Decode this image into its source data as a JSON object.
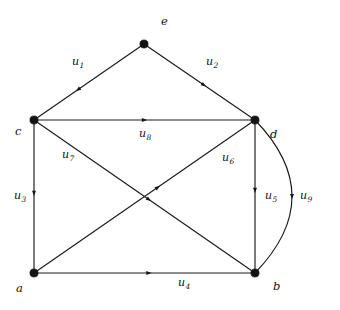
{
  "figure": {
    "type": "directed-graph-diagram",
    "background_color": "#ffffff",
    "ink_color": "#131313",
    "width": 340,
    "height": 310
  },
  "nodes": [
    {
      "id": "e",
      "label": "e",
      "x": 144,
      "y": 44,
      "label_x": 161,
      "label_y": 16
    },
    {
      "id": "c",
      "label": "c",
      "x": 34,
      "y": 120,
      "label_x": 15,
      "label_y": 126
    },
    {
      "id": "d",
      "label": "d",
      "x": 255,
      "y": 120,
      "label_x": 270,
      "label_y": 129
    },
    {
      "id": "a",
      "label": "a",
      "x": 34,
      "y": 273,
      "label_x": 16,
      "label_y": 283
    },
    {
      "id": "b",
      "label": "b",
      "x": 255,
      "y": 273,
      "label_x": 273,
      "label_y": 281
    }
  ],
  "edges": [
    {
      "id": "u1",
      "label": "u",
      "sub": "1",
      "from": "e",
      "to": "c",
      "label_x": 72,
      "label_y": 56,
      "arrow_t": 0.6,
      "curved": false
    },
    {
      "id": "u2",
      "label": "u",
      "sub": "2",
      "from": "e",
      "to": "d",
      "label_x": 206,
      "label_y": 56,
      "arrow_t": 0.54,
      "curved": false
    },
    {
      "id": "u3",
      "label": "u",
      "sub": "3",
      "from": "c",
      "to": "a",
      "label_x": 14,
      "label_y": 190,
      "arrow_t": 0.48,
      "curved": false
    },
    {
      "id": "u4",
      "label": "u",
      "sub": "4",
      "from": "a",
      "to": "b",
      "label_x": 178,
      "label_y": 277,
      "arrow_t": 0.52,
      "curved": false
    },
    {
      "id": "u5",
      "label": "u",
      "sub": "5",
      "from": "d",
      "to": "b",
      "label_x": 265,
      "label_y": 190,
      "arrow_t": 0.46,
      "curved": false
    },
    {
      "id": "u6",
      "label": "u",
      "sub": "6",
      "from": "a",
      "to": "d",
      "label_x": 222,
      "label_y": 152,
      "arrow_t": 0.56,
      "curved": false
    },
    {
      "id": "u7",
      "label": "u",
      "sub": "7",
      "from": "c",
      "to": "b",
      "label_x": 62,
      "label_y": 149,
      "arrow_t": 0.52,
      "curved": false
    },
    {
      "id": "u8",
      "label": "u",
      "sub": "8",
      "from": "c",
      "to": "d",
      "label_x": 139,
      "label_y": 128,
      "arrow_t": 0.5,
      "curved": false
    },
    {
      "id": "u9",
      "label": "u",
      "sub": "9",
      "from": "b",
      "to": "d",
      "label_x": 300,
      "label_y": 190,
      "arrow_t": 0.5,
      "curved": true,
      "bulge_x": 292
    }
  ]
}
